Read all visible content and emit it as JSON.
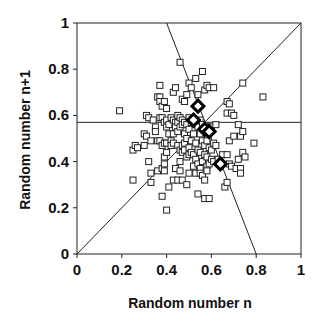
{
  "chart_data": {
    "type": "scatter",
    "title": "",
    "xlabel": "Random number n",
    "ylabel": "Random number n+1",
    "xlim": [
      0,
      1
    ],
    "ylim": [
      0,
      1
    ],
    "xticks": [
      "0",
      "0.2",
      "0.4",
      "0.6",
      "0.8",
      "1"
    ],
    "yticks": [
      "0",
      "0.2",
      "0.4",
      "0.6",
      "0.8",
      "1"
    ],
    "xtick_values": [
      0,
      0.2,
      0.4,
      0.6,
      0.8,
      1
    ],
    "ytick_values": [
      0,
      0.2,
      0.4,
      0.6,
      0.8,
      1
    ],
    "grid": false,
    "legend": "none",
    "lines": [
      {
        "name": "identity-line",
        "x": [
          0,
          1
        ],
        "y": [
          0,
          1
        ]
      },
      {
        "name": "mean-line",
        "x": [
          0,
          1
        ],
        "y": [
          0.57,
          0.57
        ]
      },
      {
        "name": "perpendicular-line",
        "x": [
          0.4,
          0.8
        ],
        "y": [
          1,
          0
        ]
      }
    ],
    "series": [
      {
        "name": "samples",
        "marker": "open-square",
        "points": [
          [
            0.19,
            0.62
          ],
          [
            0.25,
            0.32
          ],
          [
            0.25,
            0.45
          ],
          [
            0.26,
            0.47
          ],
          [
            0.27,
            0.46
          ],
          [
            0.3,
            0.47
          ],
          [
            0.3,
            0.52
          ],
          [
            0.31,
            0.51
          ],
          [
            0.31,
            0.6
          ],
          [
            0.32,
            0.59
          ],
          [
            0.32,
            0.4
          ],
          [
            0.33,
            0.35
          ],
          [
            0.33,
            0.31
          ],
          [
            0.33,
            0.49
          ],
          [
            0.34,
            0.58
          ],
          [
            0.35,
            0.55
          ],
          [
            0.35,
            0.53
          ],
          [
            0.36,
            0.68
          ],
          [
            0.36,
            0.49
          ],
          [
            0.36,
            0.36
          ],
          [
            0.37,
            0.73
          ],
          [
            0.37,
            0.68
          ],
          [
            0.37,
            0.66
          ],
          [
            0.37,
            0.59
          ],
          [
            0.37,
            0.49
          ],
          [
            0.38,
            0.64
          ],
          [
            0.38,
            0.59
          ],
          [
            0.38,
            0.47
          ],
          [
            0.38,
            0.37
          ],
          [
            0.38,
            0.25
          ],
          [
            0.39,
            0.66
          ],
          [
            0.39,
            0.57
          ],
          [
            0.39,
            0.48
          ],
          [
            0.39,
            0.42
          ],
          [
            0.39,
            0.39
          ],
          [
            0.39,
            0.36
          ],
          [
            0.4,
            0.63
          ],
          [
            0.4,
            0.58
          ],
          [
            0.4,
            0.55
          ],
          [
            0.4,
            0.48
          ],
          [
            0.4,
            0.44
          ],
          [
            0.4,
            0.19
          ],
          [
            0.41,
            0.56
          ],
          [
            0.41,
            0.52
          ],
          [
            0.41,
            0.29
          ],
          [
            0.42,
            0.59
          ],
          [
            0.42,
            0.49
          ],
          [
            0.42,
            0.47
          ],
          [
            0.43,
            0.7
          ],
          [
            0.43,
            0.58
          ],
          [
            0.43,
            0.52
          ],
          [
            0.43,
            0.48
          ],
          [
            0.43,
            0.32
          ],
          [
            0.44,
            0.72
          ],
          [
            0.44,
            0.57
          ],
          [
            0.44,
            0.55
          ],
          [
            0.44,
            0.37
          ],
          [
            0.45,
            0.6
          ],
          [
            0.45,
            0.57
          ],
          [
            0.45,
            0.53
          ],
          [
            0.45,
            0.47
          ],
          [
            0.45,
            0.32
          ],
          [
            0.46,
            0.83
          ],
          [
            0.46,
            0.59
          ],
          [
            0.46,
            0.55
          ],
          [
            0.46,
            0.45
          ],
          [
            0.46,
            0.4
          ],
          [
            0.46,
            0.36
          ],
          [
            0.47,
            0.67
          ],
          [
            0.47,
            0.58
          ],
          [
            0.47,
            0.56
          ],
          [
            0.47,
            0.47
          ],
          [
            0.47,
            0.44
          ],
          [
            0.47,
            0.32
          ],
          [
            0.48,
            0.66
          ],
          [
            0.48,
            0.57
          ],
          [
            0.48,
            0.52
          ],
          [
            0.48,
            0.48
          ],
          [
            0.48,
            0.45
          ],
          [
            0.49,
            0.69
          ],
          [
            0.49,
            0.56
          ],
          [
            0.49,
            0.5
          ],
          [
            0.49,
            0.42
          ],
          [
            0.49,
            0.3
          ],
          [
            0.5,
            0.74
          ],
          [
            0.5,
            0.59
          ],
          [
            0.5,
            0.54
          ],
          [
            0.5,
            0.46
          ],
          [
            0.5,
            0.43
          ],
          [
            0.5,
            0.35
          ],
          [
            0.51,
            0.72
          ],
          [
            0.51,
            0.57
          ],
          [
            0.51,
            0.49
          ],
          [
            0.51,
            0.44
          ],
          [
            0.52,
            0.58
          ],
          [
            0.52,
            0.52
          ],
          [
            0.52,
            0.43
          ],
          [
            0.52,
            0.38
          ],
          [
            0.53,
            0.76
          ],
          [
            0.53,
            0.56
          ],
          [
            0.53,
            0.48
          ],
          [
            0.53,
            0.41
          ],
          [
            0.53,
            0.35
          ],
          [
            0.54,
            0.69
          ],
          [
            0.54,
            0.55
          ],
          [
            0.54,
            0.45
          ],
          [
            0.54,
            0.39
          ],
          [
            0.54,
            0.26
          ],
          [
            0.55,
            0.58
          ],
          [
            0.55,
            0.52
          ],
          [
            0.55,
            0.44
          ],
          [
            0.55,
            0.37
          ],
          [
            0.55,
            0.35
          ],
          [
            0.56,
            0.79
          ],
          [
            0.56,
            0.56
          ],
          [
            0.56,
            0.49
          ],
          [
            0.56,
            0.4
          ],
          [
            0.56,
            0.34
          ],
          [
            0.57,
            0.71
          ],
          [
            0.57,
            0.47
          ],
          [
            0.57,
            0.43
          ],
          [
            0.57,
            0.32
          ],
          [
            0.57,
            0.24
          ],
          [
            0.58,
            0.73
          ],
          [
            0.58,
            0.55
          ],
          [
            0.58,
            0.49
          ],
          [
            0.58,
            0.42
          ],
          [
            0.58,
            0.38
          ],
          [
            0.58,
            0.36
          ],
          [
            0.59,
            0.72
          ],
          [
            0.59,
            0.46
          ],
          [
            0.59,
            0.39
          ],
          [
            0.59,
            0.24
          ],
          [
            0.6,
            0.55
          ],
          [
            0.6,
            0.45
          ],
          [
            0.6,
            0.41
          ],
          [
            0.61,
            0.72
          ],
          [
            0.61,
            0.48
          ],
          [
            0.61,
            0.4
          ],
          [
            0.62,
            0.56
          ],
          [
            0.62,
            0.47
          ],
          [
            0.63,
            0.41
          ],
          [
            0.64,
            0.39
          ],
          [
            0.65,
            0.43
          ],
          [
            0.66,
            0.29
          ],
          [
            0.67,
            0.66
          ],
          [
            0.67,
            0.61
          ],
          [
            0.67,
            0.43
          ],
          [
            0.67,
            0.31
          ],
          [
            0.68,
            0.65
          ],
          [
            0.68,
            0.49
          ],
          [
            0.68,
            0.39
          ],
          [
            0.69,
            0.61
          ],
          [
            0.69,
            0.38
          ],
          [
            0.7,
            0.6
          ],
          [
            0.7,
            0.51
          ],
          [
            0.71,
            0.37
          ],
          [
            0.72,
            0.56
          ],
          [
            0.72,
            0.41
          ],
          [
            0.73,
            0.51
          ],
          [
            0.73,
            0.37
          ],
          [
            0.73,
            0.35
          ],
          [
            0.74,
            0.44
          ],
          [
            0.74,
            0.74
          ],
          [
            0.74,
            0.53
          ],
          [
            0.75,
            0.42
          ],
          [
            0.79,
            0.48
          ],
          [
            0.83,
            0.68
          ]
        ]
      },
      {
        "name": "highlighted",
        "marker": "bold-diamond",
        "points": [
          [
            0.54,
            0.64
          ],
          [
            0.52,
            0.58
          ],
          [
            0.57,
            0.54
          ],
          [
            0.59,
            0.53
          ],
          [
            0.64,
            0.39
          ]
        ]
      }
    ]
  }
}
